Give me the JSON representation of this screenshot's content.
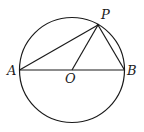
{
  "diagram": {
    "type": "geometry",
    "labels": {
      "A": "A",
      "B": "B",
      "O": "O",
      "P": "P"
    },
    "colors": {
      "stroke": "#1a1a1a",
      "background": "#ffffff"
    }
  }
}
